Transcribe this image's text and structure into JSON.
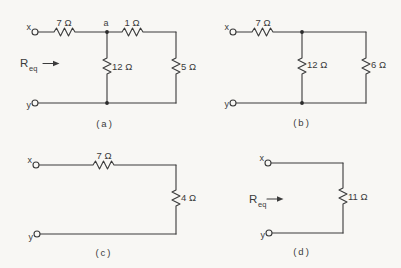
{
  "colors": {
    "ink": "#3b3b3b",
    "paper": "#f8f7f4"
  },
  "circuits": [
    {
      "id": "a",
      "caption": "(a)",
      "terminal_top": "x",
      "terminal_bottom": "y",
      "node_label": "a",
      "req_base": "R",
      "req_sub": "eq",
      "resistors": {
        "r1": "7 Ω",
        "r2": "1 Ω",
        "r3": "12 Ω",
        "r4": "5 Ω"
      }
    },
    {
      "id": "b",
      "caption": "(b)",
      "terminal_top": "x",
      "terminal_bottom": "y",
      "resistors": {
        "r1": "7 Ω",
        "r2": "12 Ω",
        "r3": "6 Ω"
      }
    },
    {
      "id": "c",
      "caption": "(c)",
      "terminal_top": "x",
      "terminal_bottom": "y",
      "resistors": {
        "r1": "7 Ω",
        "r2": "4 Ω"
      }
    },
    {
      "id": "d",
      "caption": "(d)",
      "terminal_top": "x",
      "terminal_bottom": "y",
      "req_base": "R",
      "req_sub": "eq",
      "resistors": {
        "r1": "11 Ω"
      }
    }
  ]
}
